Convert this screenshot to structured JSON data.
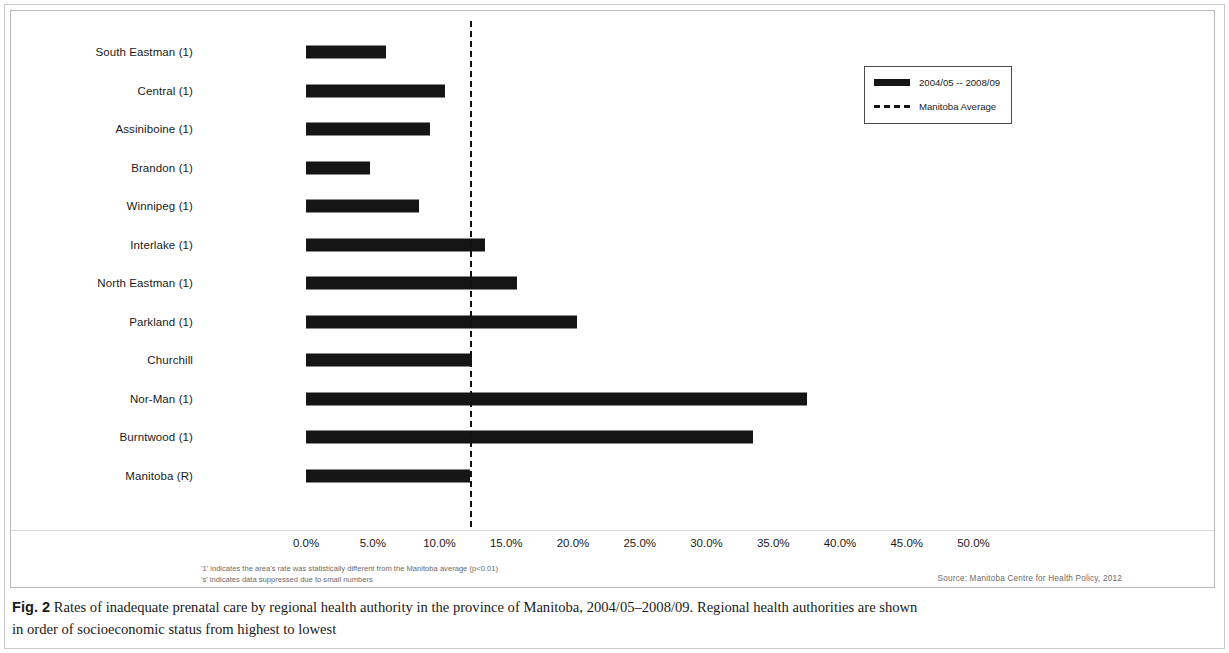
{
  "figure": {
    "caption_bold": "Fig. 2",
    "caption_line1": " Rates of inadequate prenatal care by regional health authority in the province of Manitoba, 2004/05–2008/09. Regional health authorities are shown",
    "caption_line2": "in order of socioeconomic status from highest to lowest"
  },
  "legend": {
    "series_label": "2004/05 -- 2008/09",
    "average_label": "Manitoba Average",
    "position": "top-right"
  },
  "notes": {
    "line1": "'1' indicates the area's rate was statistically different from the Manitoba average (p<0.01)",
    "line2": "'s' indicates data suppressed due to small numbers",
    "source": "Source: Manitoba Centre for Health Policy, 2012"
  },
  "chart_data": {
    "type": "bar",
    "orientation": "horizontal",
    "title": "",
    "xlabel": "",
    "ylabel": "",
    "xlim": [
      0,
      53
    ],
    "grid": false,
    "tick_labels": [
      "0.0%",
      "5.0%",
      "10.0%",
      "15.0%",
      "20.0%",
      "25.0%",
      "30.0%",
      "35.0%",
      "40.0%",
      "45.0%",
      "50.0%"
    ],
    "ticks": [
      0,
      5,
      10,
      15,
      20,
      25,
      30,
      35,
      40,
      45,
      50
    ],
    "categories": [
      "South Eastman (1)",
      "Central (1)",
      "Assiniboine (1)",
      "Brandon (1)",
      "Winnipeg (1)",
      "Interlake (1)",
      "North Eastman (1)",
      "Parkland (1)",
      "Churchill",
      "Nor-Man (1)",
      "Burntwood (1)",
      "Manitoba (R)"
    ],
    "values": [
      6.0,
      10.4,
      9.3,
      4.8,
      8.5,
      13.4,
      15.8,
      20.3,
      12.4,
      37.5,
      33.5,
      12.3
    ],
    "series": [
      {
        "name": "2004/05 -- 2008/09",
        "values": [
          6.0,
          10.4,
          9.3,
          4.8,
          8.5,
          13.4,
          15.8,
          20.3,
          12.4,
          37.5,
          33.5,
          12.3
        ]
      }
    ],
    "reference_line": {
      "label": "Manitoba Average",
      "value": 12.3,
      "style": "dashed"
    },
    "bar_color": "#151515",
    "reference_color": "#111111"
  }
}
